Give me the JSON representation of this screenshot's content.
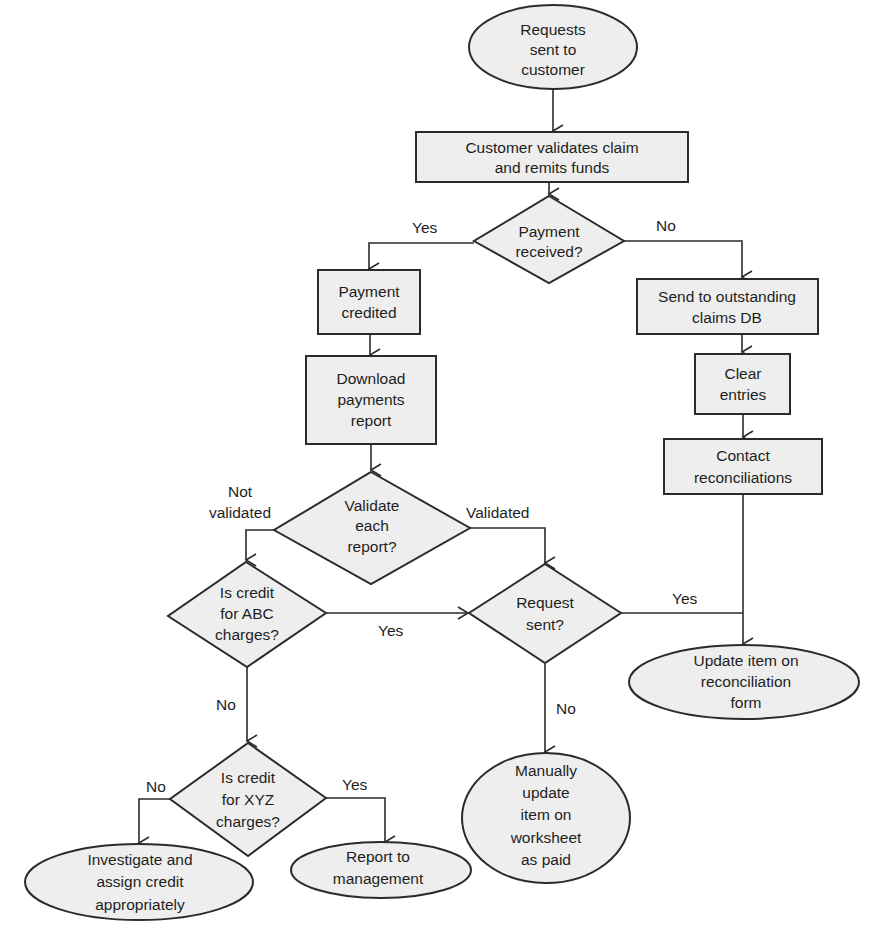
{
  "diagram": {
    "type": "flowchart",
    "nodes": {
      "start": {
        "shape": "ellipse",
        "lines": [
          "Requests",
          "sent to",
          "customer"
        ]
      },
      "validate_claim": {
        "shape": "rect",
        "lines": [
          "Customer validates claim",
          "and remits funds"
        ]
      },
      "payment_received": {
        "shape": "diamond",
        "lines": [
          "Payment",
          "received?"
        ]
      },
      "payment_credited": {
        "shape": "rect",
        "lines": [
          "Payment",
          "credited"
        ]
      },
      "send_outstanding": {
        "shape": "rect",
        "lines": [
          "Send to outstanding",
          "claims DB"
        ]
      },
      "download_report": {
        "shape": "rect",
        "lines": [
          "Download",
          "payments",
          "report"
        ]
      },
      "clear_entries": {
        "shape": "rect",
        "lines": [
          "Clear",
          "entries"
        ]
      },
      "contact_recon": {
        "shape": "rect",
        "lines": [
          "Contact",
          "reconciliations"
        ]
      },
      "validate_each": {
        "shape": "diamond",
        "lines": [
          "Validate",
          "each",
          "report?"
        ]
      },
      "credit_abc": {
        "shape": "diamond",
        "lines": [
          "Is credit",
          "for ABC",
          "charges?"
        ]
      },
      "request_sent": {
        "shape": "diamond",
        "lines": [
          "Request",
          "sent?"
        ]
      },
      "update_recon_form": {
        "shape": "ellipse",
        "lines": [
          "Update item on",
          "reconciliation",
          "form"
        ]
      },
      "credit_xyz": {
        "shape": "diamond",
        "lines": [
          "Is credit",
          "for XYZ",
          "charges?"
        ]
      },
      "manual_update": {
        "shape": "ellipse",
        "lines": [
          "Manually",
          "update",
          "item on",
          "worksheet",
          "as paid"
        ]
      },
      "investigate": {
        "shape": "ellipse",
        "lines": [
          "Investigate and",
          "assign credit",
          "appropriately"
        ]
      },
      "report_mgmt": {
        "shape": "ellipse",
        "lines": [
          "Report to",
          "management"
        ]
      }
    },
    "edge_labels": {
      "received_yes": "Yes",
      "received_no": "No",
      "not_validated_1": "Not",
      "not_validated_2": "validated",
      "validated": "Validated",
      "abc_yes": "Yes",
      "abc_no": "No",
      "request_yes": "Yes",
      "request_no": "No",
      "xyz_no": "No",
      "xyz_yes": "Yes"
    },
    "edges": [
      {
        "from": "start",
        "to": "validate_claim"
      },
      {
        "from": "validate_claim",
        "to": "payment_received"
      },
      {
        "from": "payment_received",
        "to": "payment_credited",
        "label": "Yes"
      },
      {
        "from": "payment_received",
        "to": "send_outstanding",
        "label": "No"
      },
      {
        "from": "payment_credited",
        "to": "download_report"
      },
      {
        "from": "download_report",
        "to": "validate_each"
      },
      {
        "from": "send_outstanding",
        "to": "clear_entries"
      },
      {
        "from": "clear_entries",
        "to": "contact_recon"
      },
      {
        "from": "contact_recon",
        "to": "update_recon_form"
      },
      {
        "from": "validate_each",
        "to": "credit_abc",
        "label": "Not validated"
      },
      {
        "from": "validate_each",
        "to": "request_sent",
        "label": "Validated"
      },
      {
        "from": "credit_abc",
        "to": "request_sent",
        "label": "Yes"
      },
      {
        "from": "credit_abc",
        "to": "credit_xyz",
        "label": "No"
      },
      {
        "from": "request_sent",
        "to": "update_recon_form",
        "label": "Yes"
      },
      {
        "from": "request_sent",
        "to": "manual_update",
        "label": "No"
      },
      {
        "from": "credit_xyz",
        "to": "investigate",
        "label": "No"
      },
      {
        "from": "credit_xyz",
        "to": "report_mgmt",
        "label": "Yes"
      }
    ],
    "colors": {
      "fill": "#eeeeee",
      "stroke": "#2b2b2b",
      "text": "#1e1e1e",
      "background": "#ffffff"
    }
  }
}
